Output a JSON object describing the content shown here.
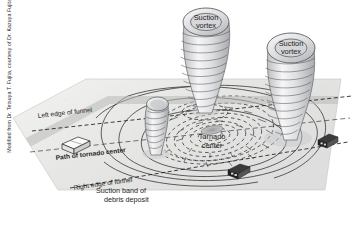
{
  "figure": {
    "type": "diagram",
    "credit": "Modified from Dr. Tetsuya T. Fujita, courtesy of Dr. Kazuya Fujita.",
    "background_color": "#ffffff",
    "ground_color": "#e8e8e6",
    "ink_color": "#1d1d1d"
  },
  "labels": {
    "suction_vortex_left": "Suction\nvortex",
    "suction_vortex_left_line1": "Suction",
    "suction_vortex_left_line2": "vortex",
    "suction_vortex_right_line1": "Suction",
    "suction_vortex_right_line2": "vortex",
    "tornado_center_line1": "Tornado",
    "tornado_center_line2": "center",
    "left_edge_of_funnel": "Left edge of funnel",
    "right_edge_of_funnel": "Right edge of funnel",
    "path_of_tornado_center": "Path of tornado center",
    "suction_band_line1": "Suction band of",
    "suction_band_line2": "debris deposit"
  },
  "objects": {
    "house": "house",
    "car_center": "car",
    "car_right": "car",
    "funnel_small_left": "suction-vortex-funnel",
    "funnel_center": "suction-vortex-funnel",
    "funnel_right": "suction-vortex-funnel"
  }
}
